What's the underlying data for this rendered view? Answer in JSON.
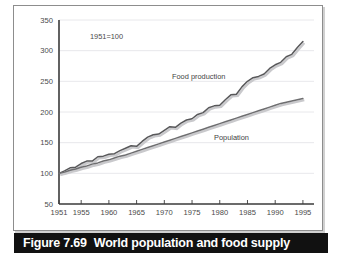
{
  "caption": {
    "number": "Figure 7.69",
    "text": "World population and food supply"
  },
  "annotations": {
    "base_note": "1951=100",
    "food_label": "Food production",
    "population_label": "Population"
  },
  "colors": {
    "food_line": "#58585a",
    "population_line": "#6e6e70",
    "axis": "#3a3a3a",
    "gridline": "#e2e2e6",
    "tick_text": "#4a4a4a",
    "caption_bar": "#111111",
    "caption_text": "#ffffff",
    "panel_border": "#8d8d8d",
    "background": "#ffffff"
  },
  "chart_data": {
    "type": "line",
    "title": "World population and food supply",
    "subtitle": "1951=100",
    "xlabel": "",
    "ylabel": "",
    "xlim": [
      1951,
      1997
    ],
    "ylim": [
      50,
      350
    ],
    "grid": true,
    "legend": "inline-annotations",
    "yticks": [
      50,
      100,
      150,
      200,
      250,
      300,
      350
    ],
    "xticks": [
      1951,
      1955,
      1960,
      1965,
      1970,
      1975,
      1980,
      1985,
      1990,
      1995
    ],
    "x": [
      1951,
      1952,
      1953,
      1954,
      1955,
      1956,
      1957,
      1958,
      1959,
      1960,
      1961,
      1962,
      1963,
      1964,
      1965,
      1966,
      1967,
      1968,
      1969,
      1970,
      1971,
      1972,
      1973,
      1974,
      1975,
      1976,
      1977,
      1978,
      1979,
      1980,
      1981,
      1982,
      1983,
      1984,
      1985,
      1986,
      1987,
      1988,
      1989,
      1990,
      1991,
      1992,
      1993,
      1994,
      1995
    ],
    "series": [
      {
        "name": "Food production",
        "color": "#58585a",
        "values": [
          100,
          104,
          109,
          110,
          116,
          120,
          120,
          127,
          128,
          131,
          132,
          137,
          141,
          145,
          144,
          152,
          159,
          163,
          164,
          170,
          176,
          175,
          182,
          187,
          189,
          196,
          199,
          207,
          210,
          211,
          220,
          228,
          229,
          241,
          250,
          256,
          258,
          262,
          271,
          277,
          281,
          290,
          294,
          305,
          315
        ]
      },
      {
        "name": "Population",
        "color": "#6e6e70",
        "values": [
          100,
          102,
          105,
          107,
          110,
          112,
          115,
          117,
          120,
          122,
          125,
          128,
          130,
          133,
          136,
          139,
          142,
          145,
          148,
          151,
          154,
          157,
          160,
          163,
          166,
          169,
          172,
          175,
          178,
          181,
          184,
          187,
          190,
          193,
          196,
          199,
          202,
          205,
          208,
          211,
          214,
          216,
          218,
          220,
          222
        ]
      }
    ]
  }
}
